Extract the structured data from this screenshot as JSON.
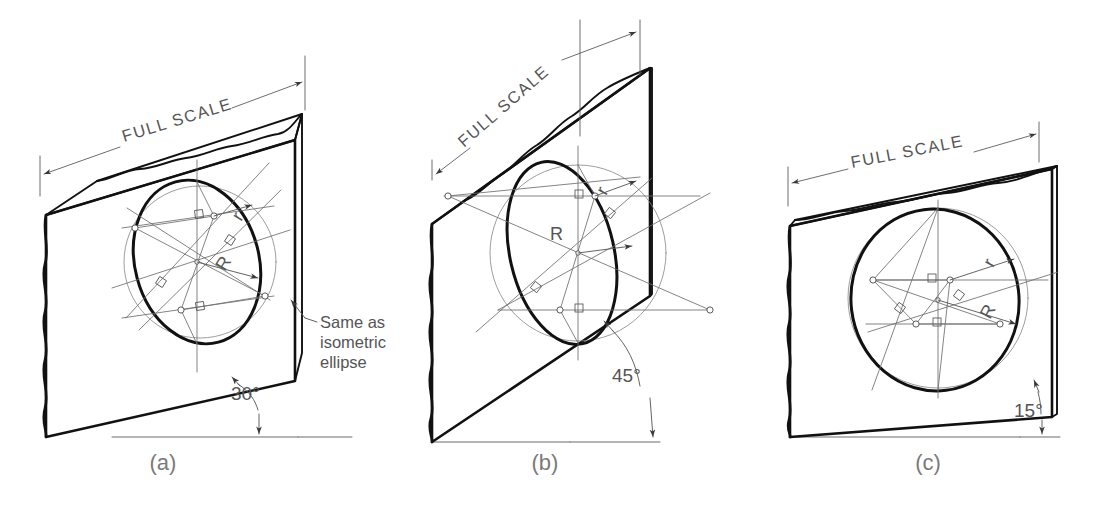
{
  "figure": {
    "background_color": "#ffffff",
    "line_color": "#111111",
    "construction_line_color": "#6e6e6e",
    "text_color": "#555555"
  },
  "panels": [
    {
      "id": "a",
      "caption": "(a)",
      "scale_label": "FULL SCALE",
      "angle_label": "30°",
      "radius_small_label": "r",
      "radius_large_label": "R",
      "note_lines": [
        "Same as",
        "isometric",
        "ellipse"
      ]
    },
    {
      "id": "b",
      "caption": "(b)",
      "scale_label": "FULL SCALE",
      "angle_label": "45°",
      "radius_small_label": "r",
      "radius_large_label": "R",
      "note_lines": []
    },
    {
      "id": "c",
      "caption": "(c)",
      "scale_label": "FULL SCALE",
      "angle_label": "15°",
      "radius_small_label": "r",
      "radius_large_label": "R",
      "note_lines": []
    }
  ]
}
